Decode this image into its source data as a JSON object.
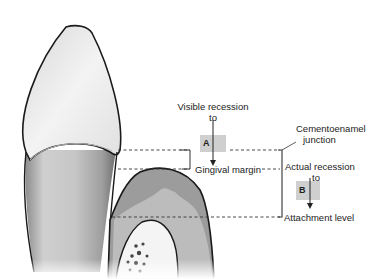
{
  "figure": {
    "colors": {
      "tooth_outline": "#1a1a1a",
      "tooth_fill": "#e4e4e4",
      "gingiva_fill": "#9a9a9a",
      "bone_fill": "#bdbdbd",
      "label_box": "#cfcfcf",
      "line": "#333333"
    }
  },
  "labels": {
    "visible_recession_line1": "Visible recession",
    "visible_recession_line2": "to",
    "box_a": "A",
    "gingival_margin": "Gingival margin",
    "cej_line1": "Cementoenamel",
    "cej_line2": "junction",
    "actual_recession_line1": "Actual recession",
    "actual_recession_line2": "to",
    "box_b": "B",
    "attachment_level": "Attachment level"
  }
}
